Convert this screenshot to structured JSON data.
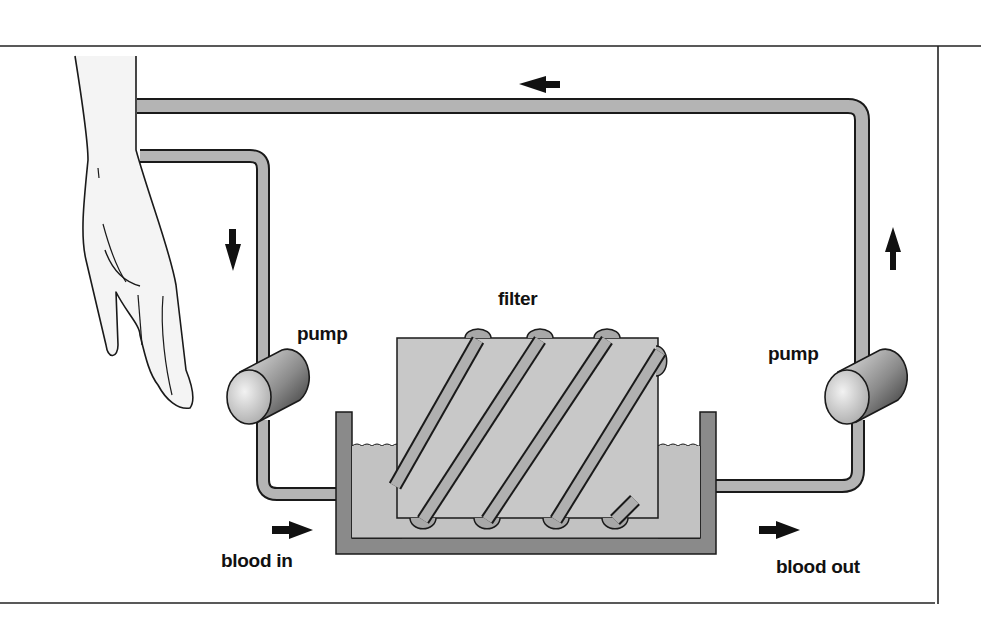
{
  "diagram": {
    "labels": {
      "filter": "filter",
      "pump_left": "pump",
      "pump_right": "pump",
      "blood_in": "blood in",
      "blood_out": "blood out"
    },
    "arrows": [
      {
        "name": "flow-arrow-top",
        "direction": "left"
      },
      {
        "name": "flow-arrow-left",
        "direction": "down"
      },
      {
        "name": "flow-arrow-right",
        "direction": "up"
      },
      {
        "name": "flow-arrow-blood-in",
        "direction": "right"
      },
      {
        "name": "flow-arrow-blood-out",
        "direction": "right"
      }
    ],
    "colors": {
      "tube_fill": "#b4b4b4",
      "outline": "#1a1a1a",
      "filter_fill": "#c8c8c8",
      "bath_fill": "#bdbdbd",
      "tank_wall": "#8a8a8a",
      "hand_fill": "#f4f4f4"
    }
  }
}
